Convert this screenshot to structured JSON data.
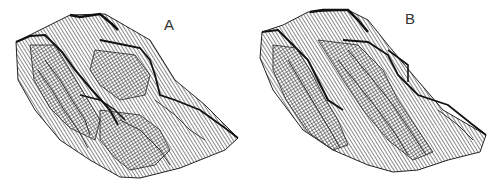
{
  "figure": {
    "panels": [
      {
        "id": "A",
        "label": "A",
        "description": "3D wireframe terrain surface rendering (hatched contour mesh)"
      },
      {
        "id": "B",
        "label": "B",
        "description": "3D wireframe terrain surface rendering (hatched contour mesh), alternative model"
      }
    ],
    "colors": {
      "background": "#ffffff",
      "line": "#1a1a1a",
      "hatch": "#3a3a3a",
      "label": "#333333"
    }
  }
}
